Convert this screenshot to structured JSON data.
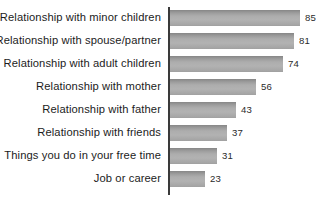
{
  "chart_data": {
    "type": "bar",
    "orientation": "horizontal",
    "title": "",
    "subtitle": "",
    "xlabel": "",
    "ylabel": "",
    "xlim": [
      0,
      85
    ],
    "grid": false,
    "legend": false,
    "legend_position": "none",
    "value_labels": true,
    "bar_color": "#adadad",
    "axis_color": "#3a3a3a",
    "background_color": "#ffffff",
    "text_color": "#1c1c1c",
    "categories": [
      "Relationship with minor children",
      "Relationship with spouse/partner",
      "Relationship with adult children",
      "Relationship with mother",
      "Relationship with father",
      "Relationship with friends",
      "Things you do in your free time",
      "Job or career"
    ],
    "values": [
      85,
      81,
      74,
      56,
      43,
      37,
      31,
      23
    ],
    "rows": [
      {
        "label": "Relationship with minor children",
        "value": 85,
        "value_text": "85"
      },
      {
        "label": "Relationship with spouse/partner",
        "value": 81,
        "value_text": "81"
      },
      {
        "label": "Relationship with adult children",
        "value": 74,
        "value_text": "74"
      },
      {
        "label": "Relationship with mother",
        "value": 56,
        "value_text": "56"
      },
      {
        "label": "Relationship with father",
        "value": 43,
        "value_text": "43"
      },
      {
        "label": "Relationship with friends",
        "value": 37,
        "value_text": "37"
      },
      {
        "label": "Things you do in your free time",
        "value": 31,
        "value_text": "31"
      },
      {
        "label": "Job or career",
        "value": 23,
        "value_text": "23"
      }
    ]
  }
}
